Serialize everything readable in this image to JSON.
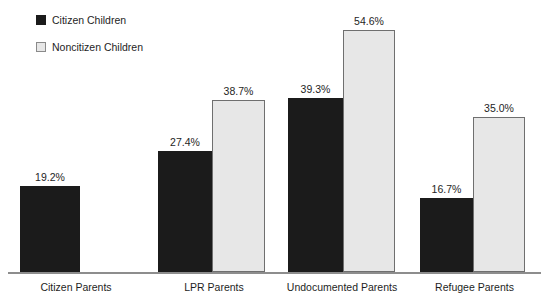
{
  "legend": {
    "position": "top-left",
    "entries": [
      {
        "label": "Citizen Children",
        "swatch": "dark-filled-square",
        "color": "#1b1b1b"
      },
      {
        "label": "Noncitizen Children",
        "swatch": "light-outlined-square",
        "color": "#e7e7e7"
      }
    ]
  },
  "chart_data": {
    "type": "bar",
    "title": "",
    "subtitle": "",
    "xlabel": "",
    "ylabel": "",
    "ylim": [
      0,
      54.6
    ],
    "grid": false,
    "legend_position": "top-left",
    "value_label_suffix": "%",
    "categories": [
      "Citizen Parents",
      "LPR Parents",
      "Undocumented Parents",
      "Refugee Parents"
    ],
    "series": [
      {
        "name": "Citizen Children",
        "color": "#1b1b1b",
        "values": [
          19.2,
          27.4,
          39.3,
          16.7
        ],
        "labels": [
          "19.2%",
          "27.4%",
          "39.3%",
          "16.7%"
        ]
      },
      {
        "name": "Noncitizen Children",
        "color": "#e7e7e7",
        "values": [
          null,
          38.7,
          54.6,
          35.0
        ],
        "labels": [
          "",
          "38.7%",
          "54.6%",
          "35.0%"
        ]
      }
    ],
    "annotations": []
  },
  "axis": {
    "baseline_color": "#8d8d8d"
  },
  "bars": [
    {
      "name": "bar-citizen-parents-citizen-children",
      "series": "Citizen Children",
      "category": "Citizen Parents",
      "value": "19.2%",
      "left": 20,
      "width": 60,
      "height": 86,
      "style": "dark"
    },
    {
      "name": "bar-lpr-parents-citizen-children",
      "series": "Citizen Children",
      "category": "LPR Parents",
      "value": "27.4%",
      "left": 158,
      "width": 54,
      "height": 121,
      "style": "dark"
    },
    {
      "name": "bar-lpr-parents-noncitizen-children",
      "series": "Noncitizen Children",
      "category": "LPR Parents",
      "value": "38.7%",
      "left": 212,
      "width": 53,
      "height": 172,
      "style": "light"
    },
    {
      "name": "bar-undocumented-parents-citizen-children",
      "series": "Citizen Children",
      "category": "Undocumented Parents",
      "value": "39.3%",
      "left": 288,
      "width": 55,
      "height": 174,
      "style": "dark"
    },
    {
      "name": "bar-undocumented-parents-noncitizen-children",
      "series": "Noncitizen Children",
      "category": "Undocumented Parents",
      "value": "54.6%",
      "left": 343,
      "width": 52,
      "height": 242,
      "style": "light"
    },
    {
      "name": "bar-refugee-parents-citizen-children",
      "series": "Citizen Children",
      "category": "Refugee Parents",
      "value": "16.7%",
      "left": 420,
      "width": 53,
      "height": 74,
      "style": "dark"
    },
    {
      "name": "bar-refugee-parents-noncitizen-children",
      "series": "Noncitizen Children",
      "category": "Refugee Parents",
      "value": "35.0%",
      "left": 473,
      "width": 52,
      "height": 155,
      "style": "light"
    }
  ],
  "value_labels": [
    {
      "name": "value-label-citizen-parents-citizen-children",
      "text": "19.2%",
      "left": 20,
      "width": 60,
      "top": 171
    },
    {
      "name": "value-label-lpr-parents-citizen-children",
      "text": "27.4%",
      "left": 158,
      "width": 54,
      "top": 136
    },
    {
      "name": "value-label-lpr-parents-noncitizen-children",
      "text": "38.7%",
      "left": 212,
      "width": 53,
      "top": 85
    },
    {
      "name": "value-label-undocumented-parents-citizen-children",
      "text": "39.3%",
      "left": 288,
      "width": 55,
      "top": 83
    },
    {
      "name": "value-label-undocumented-parents-noncitizen-children",
      "text": "54.6%",
      "left": 343,
      "width": 52,
      "top": 15
    },
    {
      "name": "value-label-refugee-parents-citizen-children",
      "text": "16.7%",
      "left": 420,
      "width": 53,
      "top": 183
    },
    {
      "name": "value-label-refugee-parents-noncitizen-children",
      "text": "35.0%",
      "left": 473,
      "width": 52,
      "top": 102
    }
  ],
  "category_labels": [
    {
      "name": "category-label-citizen-parents",
      "text": "Citizen Parents",
      "left": 0,
      "width": 152
    },
    {
      "name": "category-label-lpr-parents",
      "text": "LPR Parents",
      "left": 152,
      "width": 124
    },
    {
      "name": "category-label-undocumented-parents",
      "text": "Undocumented Parents",
      "left": 276,
      "width": 132
    },
    {
      "name": "category-label-refugee-parents",
      "text": "Refugee Parents",
      "left": 408,
      "width": 133
    }
  ]
}
